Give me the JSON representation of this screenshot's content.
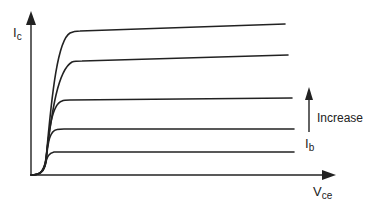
{
  "diagram": {
    "y_axis": {
      "label_main": "I",
      "label_sub": "c"
    },
    "x_axis": {
      "label_main": "V",
      "label_sub": "ce"
    },
    "annotation": {
      "text": "Increase",
      "param_main": "I",
      "param_sub": "b"
    },
    "colors": {
      "stroke": "#222222",
      "background": "#ffffff"
    },
    "curves": [
      {
        "name": "Ib5",
        "knee_y": 32,
        "end_y": 24,
        "end_x": 285
      },
      {
        "name": "Ib4",
        "knee_y": 61,
        "end_y": 55,
        "end_x": 288
      },
      {
        "name": "Ib3",
        "knee_y": 100,
        "end_y": 98,
        "end_x": 292
      },
      {
        "name": "Ib2",
        "knee_y": 129,
        "end_y": 129,
        "end_x": 294
      },
      {
        "name": "Ib1",
        "knee_y": 152,
        "end_y": 152,
        "end_x": 294
      }
    ]
  }
}
